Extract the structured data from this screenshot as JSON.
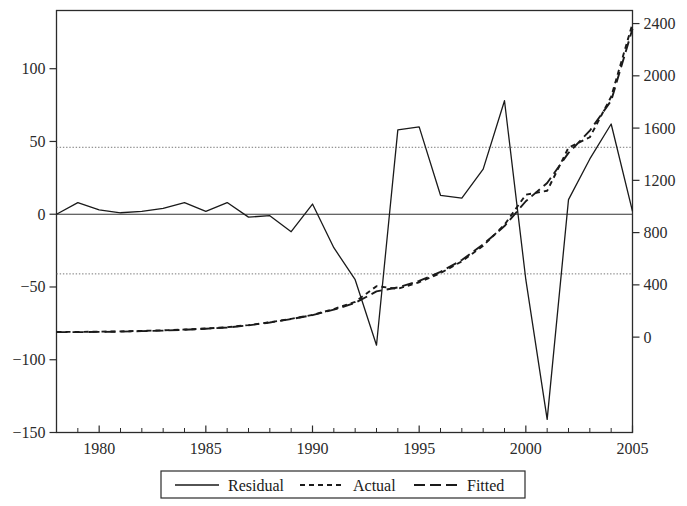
{
  "chart_data": {
    "type": "line",
    "title": "",
    "subtitle": "",
    "xlabel": "",
    "ylabel": "",
    "y2label": "",
    "grid": false,
    "legend_position": "bottom",
    "x": [
      1978,
      1979,
      1980,
      1981,
      1982,
      1983,
      1984,
      1985,
      1986,
      1987,
      1988,
      1989,
      1990,
      1991,
      1992,
      1993,
      1994,
      1995,
      1996,
      1997,
      1998,
      1999,
      2000,
      2001,
      2002,
      2003,
      2004,
      2005
    ],
    "xlim": [
      1978,
      2005
    ],
    "xticks": [
      1980,
      1985,
      1990,
      1995,
      2000,
      2005
    ],
    "xticklabels": [
      "1980",
      "1985",
      "1990",
      "1995",
      "2000",
      "2005"
    ],
    "xminor_step": 1,
    "ylim_left": [
      -150,
      140
    ],
    "yticks_left": [
      -150,
      -100,
      -50,
      0,
      50,
      100
    ],
    "yticklabels_left": [
      "−150",
      "−100",
      "−50",
      "0",
      "50",
      "100"
    ],
    "ylim_right": [
      -730,
      2500
    ],
    "yticks_right": [
      0,
      400,
      800,
      1200,
      1600,
      2000,
      2400
    ],
    "yticklabels_right": [
      "0",
      "400",
      "800",
      "1200",
      "1600",
      "2000",
      "2400"
    ],
    "reference_lines": {
      "style": "dotted",
      "axis": "left",
      "values": [
        46,
        -41
      ]
    },
    "zero_line": {
      "style": "solid",
      "axis": "left",
      "value": 0
    },
    "series": [
      {
        "name": "Residual",
        "axis": "left",
        "style": "solid",
        "values": [
          0,
          8,
          3,
          1,
          2,
          4,
          8,
          2,
          8,
          -2,
          -1,
          -12,
          7,
          -23,
          -45,
          -90,
          58,
          60,
          13,
          11,
          31,
          78,
          -45,
          -141,
          10,
          38,
          62,
          2
        ]
      },
      {
        "name": "Actual",
        "axis": "right",
        "style": "dashed-fine",
        "values": [
          40,
          40,
          42,
          44,
          48,
          52,
          58,
          66,
          76,
          92,
          114,
          140,
          170,
          215,
          270,
          390,
          370,
          420,
          490,
          580,
          700,
          860,
          1090,
          1120,
          1450,
          1530,
          1840,
          2400
        ]
      },
      {
        "name": "Fitted",
        "axis": "right",
        "style": "dashed-long",
        "values": [
          38,
          38,
          40,
          42,
          46,
          50,
          56,
          64,
          74,
          90,
          112,
          138,
          168,
          210,
          262,
          350,
          380,
          430,
          500,
          590,
          710,
          850,
          1040,
          1180,
          1410,
          1580,
          1810,
          2360
        ]
      }
    ],
    "legend": [
      {
        "label": "Residual",
        "style": "solid"
      },
      {
        "label": "Actual",
        "style": "dashed-fine"
      },
      {
        "label": "Fitted",
        "style": "dashed-long"
      }
    ]
  }
}
